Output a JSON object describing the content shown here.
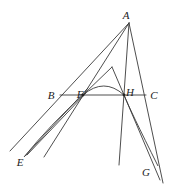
{
  "diagram": {
    "type": "geometry-construction",
    "stroke_color": "#3a3a3a",
    "labels": [
      {
        "id": "A",
        "text": "A",
        "x": 126,
        "y": 15
      },
      {
        "id": "B",
        "text": "B",
        "x": 51,
        "y": 95
      },
      {
        "id": "F",
        "text": "F",
        "x": 80,
        "y": 94
      },
      {
        "id": "H",
        "text": "H",
        "x": 130,
        "y": 92
      },
      {
        "id": "C",
        "text": "C",
        "x": 154,
        "y": 95
      },
      {
        "id": "E",
        "text": "E",
        "x": 20,
        "y": 162
      },
      {
        "id": "G",
        "text": "G",
        "x": 146,
        "y": 172
      }
    ],
    "points": {
      "A": [
        129,
        23
      ],
      "F": [
        83,
        95
      ],
      "H": [
        124,
        95
      ],
      "T": [
        112,
        67
      ]
    },
    "segments": [
      {
        "name": "line-A-B-extended",
        "x1": 129,
        "y1": 23,
        "x2": 10,
        "y2": 151
      },
      {
        "name": "line-A-F-extended",
        "x1": 129,
        "y1": 23,
        "x2": 44,
        "y2": 157
      },
      {
        "name": "line-A-H-extended",
        "x1": 129,
        "y1": 23,
        "x2": 119,
        "y2": 165
      },
      {
        "name": "line-A-C-extended",
        "x1": 129,
        "y1": 23,
        "x2": 163,
        "y2": 183
      },
      {
        "name": "line-B-C",
        "x1": 60,
        "y1": 95,
        "x2": 146,
        "y2": 95
      },
      {
        "name": "line-F-T",
        "x1": 83,
        "y1": 95,
        "x2": 112,
        "y2": 67
      },
      {
        "name": "line-T-H",
        "x1": 112,
        "y1": 67,
        "x2": 124,
        "y2": 95
      },
      {
        "name": "line-E-F-1",
        "x1": 25,
        "y1": 156,
        "x2": 88,
        "y2": 88
      },
      {
        "name": "line-E-F-2",
        "x1": 27,
        "y1": 155,
        "x2": 86,
        "y2": 93
      },
      {
        "name": "line-H-G",
        "x1": 124,
        "y1": 95,
        "x2": 160,
        "y2": 180
      }
    ],
    "curves": [
      {
        "name": "arc-F-H",
        "d": "M 83 95 Q 104 77 124 95"
      },
      {
        "name": "curve-F-E",
        "d": "M 83 95 Q 50 125 24 157"
      },
      {
        "name": "curve-H-G",
        "d": "M 124 95 Q 130 110 158 166"
      }
    ]
  }
}
